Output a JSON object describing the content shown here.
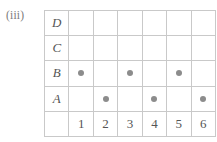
{
  "figure": {
    "part_label": "(iii)"
  },
  "chart_data": {
    "type": "scatter",
    "title": "",
    "subtitle": "",
    "xlabel": "",
    "ylabel": "",
    "grid": true,
    "legend_position": "none",
    "categories": [
      "1",
      "2",
      "3",
      "4",
      "5",
      "6"
    ],
    "row_labels": [
      "D",
      "C",
      "B",
      "A"
    ],
    "row_labels_bottom_to_top": [
      "A",
      "B",
      "C",
      "D"
    ],
    "points": [
      {
        "x": "1",
        "y": "B"
      },
      {
        "x": "2",
        "y": "A"
      },
      {
        "x": "3",
        "y": "B"
      },
      {
        "x": "4",
        "y": "A"
      },
      {
        "x": "5",
        "y": "B"
      },
      {
        "x": "6",
        "y": "A"
      }
    ],
    "matrix": {
      "D": [
        false,
        false,
        false,
        false,
        false,
        false
      ],
      "C": [
        false,
        false,
        false,
        false,
        false,
        false
      ],
      "B": [
        true,
        false,
        true,
        false,
        true,
        false
      ],
      "A": [
        false,
        true,
        false,
        true,
        false,
        true
      ]
    },
    "colors": {
      "dot": "#8c8c8c",
      "grid_line": "#c9c9c9",
      "corner_cell": "#e4e4e4",
      "text": "#555555",
      "background": "#ffffff"
    }
  },
  "grid": {
    "rows": [
      {
        "label": "D",
        "cells": [
          {
            "dot": false
          },
          {
            "dot": false
          },
          {
            "dot": false
          },
          {
            "dot": false
          },
          {
            "dot": false
          },
          {
            "dot": false
          }
        ]
      },
      {
        "label": "C",
        "cells": [
          {
            "dot": false
          },
          {
            "dot": false
          },
          {
            "dot": false
          },
          {
            "dot": false
          },
          {
            "dot": false
          },
          {
            "dot": false
          }
        ]
      },
      {
        "label": "B",
        "cells": [
          {
            "dot": true
          },
          {
            "dot": false
          },
          {
            "dot": true
          },
          {
            "dot": false
          },
          {
            "dot": true
          },
          {
            "dot": false
          }
        ]
      },
      {
        "label": "A",
        "cells": [
          {
            "dot": false
          },
          {
            "dot": true
          },
          {
            "dot": false
          },
          {
            "dot": true
          },
          {
            "dot": false
          },
          {
            "dot": true
          }
        ]
      }
    ],
    "corner_label": "",
    "column_headers": [
      "1",
      "2",
      "3",
      "4",
      "5",
      "6"
    ]
  }
}
